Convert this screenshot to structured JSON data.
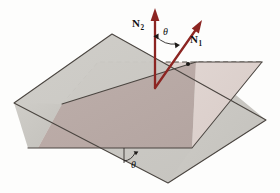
{
  "figure": {
    "background_color": "#fdfdfc",
    "planes": [
      {
        "name": "tilted-plane",
        "fill_color": "#c9c7c2",
        "edge_color": "#4a4540",
        "description": "gray inclined plane"
      },
      {
        "name": "horizontal-plane",
        "fill_color": "#ddd1cd",
        "edge_color": "#4a4540",
        "description": "pink horizontal plane"
      },
      {
        "name": "overlap-region",
        "fill_color": "#b7a7a3",
        "description": "shaded intersection of both planes"
      }
    ],
    "vectors": [
      {
        "name": "N2",
        "label": "N",
        "subscript": "2",
        "color": "#8c2522",
        "orientation": "vertical",
        "description": "normal to horizontal plane"
      },
      {
        "name": "N1",
        "label": "N",
        "subscript": "1",
        "color": "#8c2522",
        "orientation": "tilted-right",
        "description": "normal to inclined plane"
      }
    ],
    "angles": [
      {
        "name": "angle-between-normals",
        "label": "θ",
        "location": "between N2 and N1",
        "color": "#1c1a18"
      },
      {
        "name": "dihedral-angle",
        "label": "θ",
        "location": "at plane intersection, lower front",
        "color": "#1c1a18"
      }
    ]
  }
}
